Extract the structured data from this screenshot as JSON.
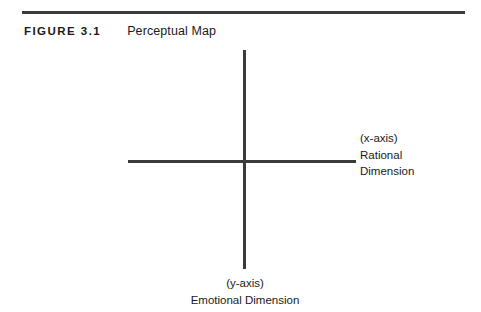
{
  "figure": {
    "number": "FIGURE 3.1",
    "title": "Perceptual Map"
  },
  "diagram": {
    "type": "perceptual-map",
    "x_axis": {
      "lines": [
        "(x-axis)",
        "Rational",
        "Dimension"
      ],
      "line1": "(x-axis)",
      "line2": "Rational",
      "line3": "Dimension"
    },
    "y_axis": {
      "lines": [
        "(y-axis)",
        "Emotional Dimension"
      ],
      "line1": "(y-axis)",
      "line2": "Emotional Dimension"
    },
    "colors": {
      "axis": "#3b3b3b",
      "rule": "#3b3b3b",
      "text": "#1a1a1a",
      "background": "#ffffff"
    }
  }
}
